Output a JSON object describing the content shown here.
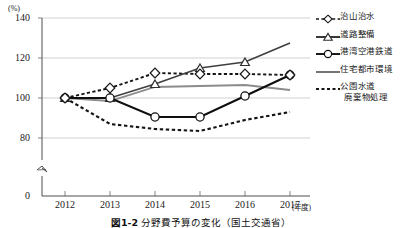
{
  "axis": {
    "y_unit": "(%)",
    "y_ticks": [
      "140",
      "120",
      "100",
      "80",
      "0"
    ],
    "x_ticks": [
      "2012",
      "2013",
      "2014",
      "2015",
      "2016",
      "2017"
    ],
    "x_unit": "(年度)",
    "break_marker": "axis-break"
  },
  "legend": {
    "items": [
      {
        "label": "治山治水",
        "style": "dotted-diamond",
        "color": "#1a1a1a"
      },
      {
        "label": "道路整備",
        "style": "solid-triangle",
        "color": "#3a3a3a"
      },
      {
        "label": "港湾空港鉄道",
        "style": "solid-circle",
        "color": "#111111"
      },
      {
        "label": "住宅都市環境",
        "style": "solid-plain",
        "color": "#8c8c8c"
      },
      {
        "label": "公園水道",
        "label2": "廃棄物処理",
        "style": "dotted-plain",
        "color": "#1a1a1a"
      }
    ]
  },
  "caption": {
    "figure_number": "図1-2",
    "text": "分野費予算の変化（国土交通省）"
  },
  "chart_data": {
    "type": "line",
    "title": "分野費予算の変化（国土交通省）",
    "xlabel": "年度",
    "ylabel": "(%)",
    "ylim": [
      0,
      140
    ],
    "yticks": [
      80,
      100,
      120,
      140
    ],
    "grid": true,
    "axis_break": true,
    "legend_position": "right",
    "categories": [
      "2012",
      "2013",
      "2014",
      "2015",
      "2016",
      "2017"
    ],
    "series": [
      {
        "name": "治山治水",
        "values": [
          100,
          105,
          112.5,
          112,
          112,
          111.5
        ],
        "marker": "diamond",
        "line": "dotted",
        "color": "#1a1a1a"
      },
      {
        "name": "道路整備",
        "values": [
          100,
          100,
          107,
          115,
          118,
          127.5
        ],
        "marker": "triangle",
        "line": "solid",
        "color": "#3a3a3a"
      },
      {
        "name": "港湾空港鉄道",
        "values": [
          100,
          100,
          90.5,
          90.5,
          101,
          111.5
        ],
        "marker": "circle",
        "line": "solid",
        "color": "#111111"
      },
      {
        "name": "住宅都市環境",
        "values": [
          100,
          98.5,
          105.5,
          106,
          106.5,
          104
        ],
        "marker": "none",
        "line": "solid",
        "color": "#8c8c8c"
      },
      {
        "name": "公園水道廃棄物処理",
        "values": [
          100,
          87,
          84.5,
          83.5,
          89,
          93
        ],
        "marker": "none",
        "line": "dotted",
        "color": "#1a1a1a"
      }
    ]
  }
}
